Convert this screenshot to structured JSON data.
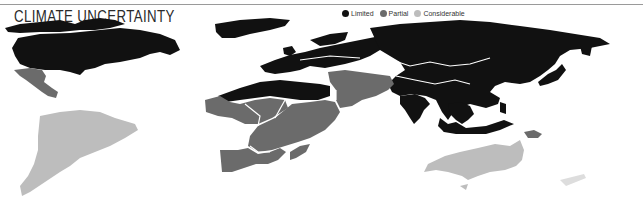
{
  "title": "CLIMATE UNCERTAINTY",
  "legend": {
    "items": [
      {
        "label": "Limited",
        "color": "#111111"
      },
      {
        "label": "Partial",
        "color": "#6b6b6b"
      },
      {
        "label": "Considerable",
        "color": "#bdbdbd"
      }
    ]
  },
  "regions": [
    {
      "name": "North America",
      "category": "Limited"
    },
    {
      "name": "Greenland",
      "category": "Limited"
    },
    {
      "name": "Central America & Mexico",
      "category": "Partial"
    },
    {
      "name": "South America",
      "category": "Considerable"
    },
    {
      "name": "Europe",
      "category": "Limited"
    },
    {
      "name": "North Africa",
      "category": "Limited"
    },
    {
      "name": "Sub-Saharan Africa",
      "category": "Partial"
    },
    {
      "name": "Middle East",
      "category": "Partial"
    },
    {
      "name": "Russia & Central Asia",
      "category": "Limited"
    },
    {
      "name": "South & East Asia",
      "category": "Limited"
    },
    {
      "name": "Southeast Asia",
      "category": "Limited"
    },
    {
      "name": "Papua New Guinea",
      "category": "Partial"
    },
    {
      "name": "Australia",
      "category": "Considerable"
    }
  ]
}
